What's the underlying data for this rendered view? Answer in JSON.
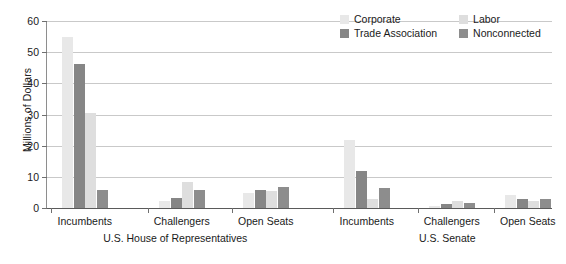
{
  "chart_data": {
    "type": "bar",
    "title": "",
    "xlabel": "",
    "ylabel": "Millions of Dollars",
    "ylim": [
      0,
      60
    ],
    "yticks": [
      0,
      10,
      20,
      30,
      40,
      50,
      60
    ],
    "ytick_labels": [
      "0",
      "10",
      "20",
      "30",
      "40",
      "50",
      "60"
    ],
    "grid": true,
    "legend_position": "top-right",
    "panels": [
      {
        "name": "U.S. House of Representatives",
        "categories": [
          "Incumbents",
          "Challengers",
          "Open Seats"
        ]
      },
      {
        "name": "U.S. Senate",
        "categories": [
          "Incumbents",
          "Challengers",
          "Open Seats"
        ]
      }
    ],
    "categories": [
      "House Incumbents",
      "House Challengers",
      "House Open Seats",
      "Senate Incumbents",
      "Senate Challengers",
      "Senate Open Seats"
    ],
    "series": [
      {
        "name": "Corporate",
        "color": "#e8e8e8",
        "values": [
          54.8,
          2.3,
          4.9,
          21.8,
          0.7,
          4.3
        ]
      },
      {
        "name": "Trade Association",
        "color": "#868686",
        "values": [
          46.2,
          3.3,
          5.8,
          11.8,
          1.3,
          3.0
        ]
      },
      {
        "name": "Labor",
        "color": "#dedede",
        "values": [
          30.6,
          8.2,
          5.3,
          2.9,
          2.3,
          2.2
        ]
      },
      {
        "name": "Nonconnected",
        "color": "#8d8d8d",
        "values": [
          5.7,
          5.7,
          6.9,
          6.3,
          1.7,
          2.8
        ]
      }
    ]
  },
  "legend": {
    "items": [
      {
        "label": "Corporate",
        "color": "#e8e8e8"
      },
      {
        "label": "Labor",
        "color": "#dedede"
      },
      {
        "label": "Trade Association",
        "color": "#868686"
      },
      {
        "label": "Nonconnected",
        "color": "#8d8d8d"
      }
    ]
  },
  "axis": {
    "y_title": "Millions of Dollars"
  }
}
